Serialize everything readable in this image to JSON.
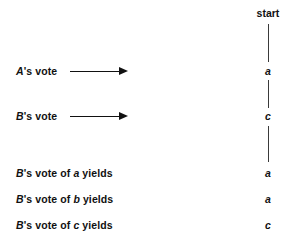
{
  "figure": {
    "title": "start",
    "background_color": "#ffffff",
    "ink_color": "#111111",
    "line_color": "#3a3a3a"
  },
  "timeline": {
    "header": {
      "label": "start",
      "x": 248,
      "y": 8
    },
    "segments": [
      {
        "name": "segment-start-to-a",
        "x": 268,
        "y": 24,
        "height": 38
      },
      {
        "name": "segment-a-to-c",
        "x": 268,
        "y": 80,
        "height": 28
      },
      {
        "name": "segment-c-to-results",
        "x": 268,
        "y": 126,
        "height": 36
      }
    ],
    "nodes": [
      {
        "name": "node-a",
        "label": "a",
        "style": "italic",
        "x": 248,
        "y": 66
      },
      {
        "name": "node-c",
        "label": "c",
        "style": "italic",
        "x": 248,
        "y": 111
      },
      {
        "name": "result-a-1",
        "label": "a",
        "style": "italic",
        "x": 248,
        "y": 168
      },
      {
        "name": "result-a-2",
        "label": "a",
        "style": "italic",
        "x": 248,
        "y": 194
      },
      {
        "name": "result-c-1",
        "label": "c",
        "style": "italic",
        "x": 248,
        "y": 220
      }
    ]
  },
  "rows": [
    {
      "name": "row-a-vote",
      "y": 66,
      "parts": [
        {
          "text": "A",
          "style": "var"
        },
        {
          "text": "'s vote",
          "style": "plain"
        }
      ],
      "arrow": {
        "x": 70,
        "y": 67,
        "length": 58
      }
    },
    {
      "name": "row-b-vote",
      "y": 111,
      "parts": [
        {
          "text": "B",
          "style": "var"
        },
        {
          "text": "'s vote",
          "style": "plain"
        }
      ],
      "arrow": {
        "x": 70,
        "y": 112,
        "length": 58
      }
    },
    {
      "name": "row-b-vote-of-a",
      "y": 168,
      "parts": [
        {
          "text": "B",
          "style": "var"
        },
        {
          "text": "'s vote of ",
          "style": "plain"
        },
        {
          "text": "a",
          "style": "var"
        },
        {
          "text": " yields",
          "style": "plain"
        }
      ],
      "arrow": null
    },
    {
      "name": "row-b-vote-of-b",
      "y": 194,
      "parts": [
        {
          "text": "B",
          "style": "var"
        },
        {
          "text": "'s vote of ",
          "style": "plain"
        },
        {
          "text": "b",
          "style": "var"
        },
        {
          "text": " yields",
          "style": "plain"
        }
      ],
      "arrow": null
    },
    {
      "name": "row-b-vote-of-c",
      "y": 220,
      "parts": [
        {
          "text": "B",
          "style": "var"
        },
        {
          "text": "'s vote of ",
          "style": "plain"
        },
        {
          "text": "c",
          "style": "var"
        },
        {
          "text": " yields",
          "style": "plain"
        }
      ],
      "arrow": null
    }
  ]
}
